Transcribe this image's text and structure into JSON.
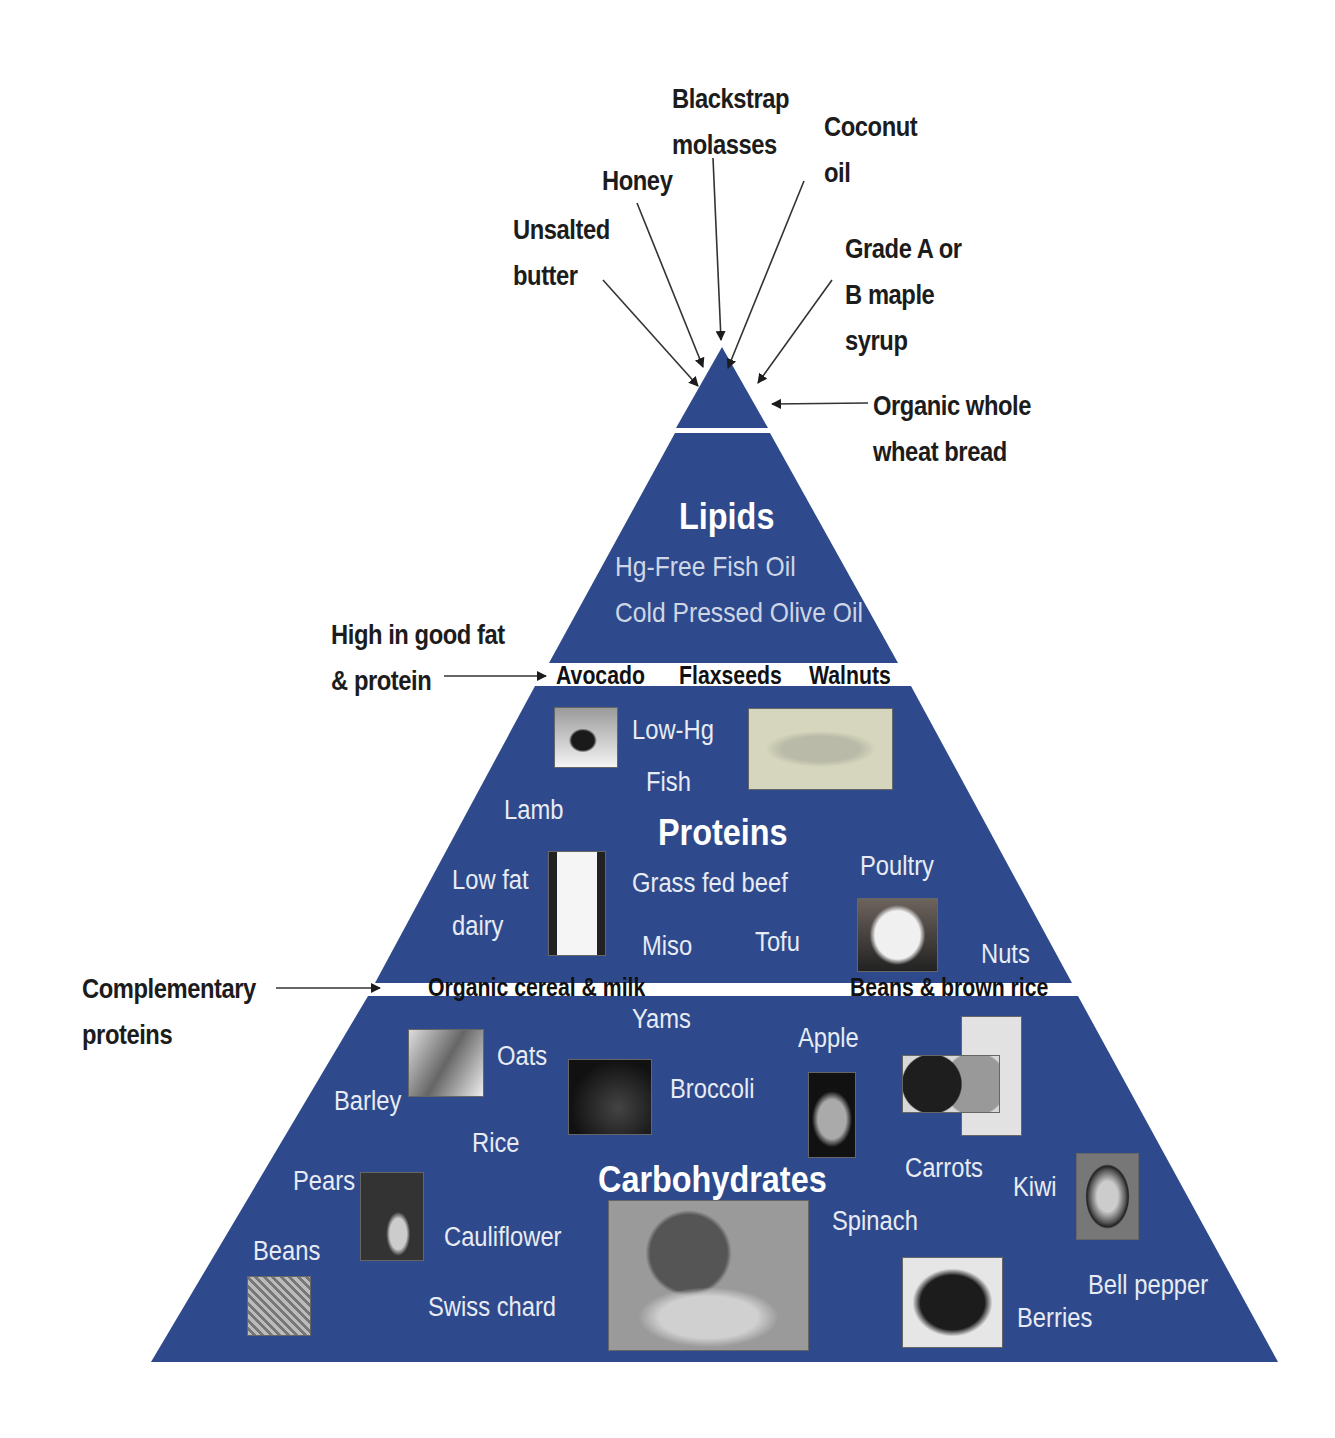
{
  "colors": {
    "pyramid_fill": "#2e4a8c",
    "band_fill": "#ffffff",
    "external_text": "#1c1c1c",
    "inner_text": "#e8ebf3"
  },
  "tip": {
    "labels": {
      "unsalted_butter": [
        "Unsalted",
        "butter"
      ],
      "honey": "Honey",
      "blackstrap": [
        "Blackstrap",
        "molasses"
      ],
      "coconut": [
        "Coconut",
        "oil"
      ],
      "maple": [
        "Grade A or",
        "B maple",
        "syrup"
      ],
      "bread": [
        "Organic whole",
        "wheat bread"
      ]
    }
  },
  "lipids": {
    "title": "Lipids",
    "items": [
      "Hg-Free Fish Oil",
      "Cold Pressed Olive Oil"
    ],
    "callout": [
      "High in good fat",
      "& protein"
    ],
    "band_items": [
      "Avocado",
      "Flaxseeds",
      "Walnuts"
    ]
  },
  "proteins": {
    "title": "Proteins",
    "items": {
      "low_hg": "Low-Hg",
      "fish": "Fish",
      "lamb": "Lamb",
      "low_fat": "Low fat",
      "dairy": "dairy",
      "grass_fed_beef": "Grass fed beef",
      "poultry": "Poultry",
      "miso": "Miso",
      "tofu": "Tofu",
      "nuts": "Nuts"
    },
    "photos": [
      "avocado-photo",
      "fish-photo",
      "milk-glass-photo",
      "egg-photo"
    ],
    "callout": [
      "Complementary",
      "proteins"
    ],
    "band_items": [
      "Organic cereal & milk",
      "Beans & brown rice"
    ]
  },
  "carbohydrates": {
    "title": "Carbohydrates",
    "items": {
      "yams": "Yams",
      "oats": "Oats",
      "barley": "Barley",
      "rice": "Rice",
      "broccoli": "Broccoli",
      "apple": "Apple",
      "carrots": "Carrots",
      "kiwi": "Kiwi",
      "pears": "Pears",
      "cauliflower": "Cauliflower",
      "beans": "Beans",
      "swiss_chard": "Swiss chard",
      "spinach": "Spinach",
      "bell_pepper": "Bell pepper",
      "berries": "Berries"
    },
    "photos": [
      "oats-photo",
      "broccoli-photo",
      "apple-photo",
      "grain-bowls-photo",
      "pear-photo",
      "beans-photo",
      "vegetable-basket-photo",
      "berries-photo",
      "kiwi-photo"
    ]
  }
}
